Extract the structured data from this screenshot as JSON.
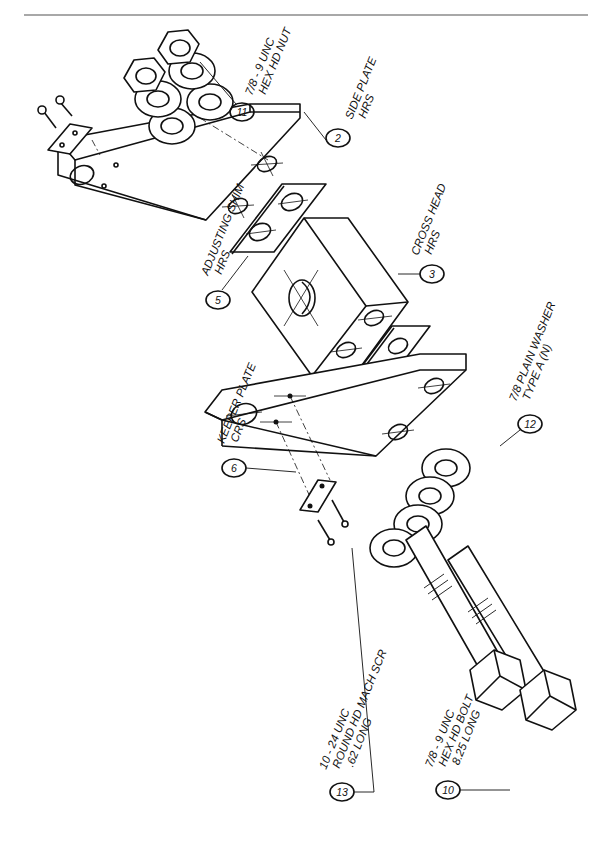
{
  "drawing": {
    "type": "exploded isometric assembly",
    "callouts": [
      {
        "id": "part-2",
        "number": "2",
        "lines": [
          "SIDE PLATE",
          "HRS"
        ]
      },
      {
        "id": "part-3",
        "number": "3",
        "lines": [
          "CROSS HEAD",
          "HRS"
        ]
      },
      {
        "id": "part-5",
        "number": "5",
        "lines": [
          "ADJUSTING SHIM",
          "HRS"
        ]
      },
      {
        "id": "part-6",
        "number": "6",
        "lines": [
          "KEEPER PLATE",
          "CRS"
        ]
      },
      {
        "id": "part-10",
        "number": "10",
        "lines": [
          "7/8 - 9 UNC",
          "HEX HD BOLT",
          "8.25 LONG"
        ]
      },
      {
        "id": "part-11",
        "number": "11",
        "lines": [
          "7/8 - 9 UNC",
          "HEX HD NUT"
        ]
      },
      {
        "id": "part-12",
        "number": "12",
        "lines": [
          "7/8 PLAIN WASHER",
          "TYPE A (N)"
        ]
      },
      {
        "id": "part-13",
        "number": "13",
        "lines": [
          "10 - 24 UNC",
          "ROUND HD MACH SCR",
          ".62 LONG"
        ]
      }
    ]
  },
  "colors": {
    "ink": "#111111",
    "paper": "#ffffff",
    "rule": "#a8a8a8"
  }
}
